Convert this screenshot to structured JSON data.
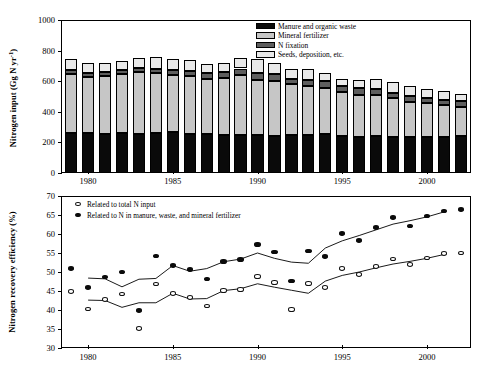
{
  "figure": {
    "panels": [
      "nitrogen-input-stacked-bar",
      "nitrogen-recovery-efficiency-scatter"
    ]
  },
  "top_panel": {
    "y_axis_title_main": "Nitrogen input (Gg N yr",
    "y_axis_title_sup": "-1",
    "y_axis_title_close": ")",
    "y_ticks": [
      "0",
      "200",
      "400",
      "600",
      "800",
      "1000"
    ],
    "x_ticks": [
      "1980",
      "1985",
      "1990",
      "1995",
      "2000"
    ],
    "legend": [
      {
        "key": "manure",
        "label": "Manure and organic waste"
      },
      {
        "key": "mineral",
        "label": "Mineral fertilizer"
      },
      {
        "key": "fixation",
        "label": "N fixation"
      },
      {
        "key": "seeds",
        "label": "Seeds, deposition, etc."
      }
    ]
  },
  "bottom_panel": {
    "y_axis_title": "Nitrogen recovery efficiency (%)",
    "y_ticks": [
      "30",
      "35",
      "40",
      "45",
      "50",
      "55",
      "60",
      "65",
      "70"
    ],
    "x_ticks": [
      "1980",
      "1985",
      "1990",
      "1995",
      "2000"
    ],
    "legend": [
      {
        "key": "open",
        "label": "Related to total N input"
      },
      {
        "key": "filled",
        "label": "Related to N in manure, waste, and mineral fertilizer"
      }
    ]
  },
  "colors": {
    "manure": "#0a0a0a",
    "mineral": "#c6c6c6",
    "fixation": "#5e5e5e",
    "seeds": "#e9e9e9",
    "axis": "#000000",
    "open_marker_fill": "#ffffff",
    "filled_marker_fill": "#0b0b0b"
  },
  "chart_data": [
    {
      "type": "bar",
      "id": "nitrogen-input-stacked-bar",
      "title": "",
      "xlabel": "",
      "ylabel": "Nitrogen input (Gg N yr-1)",
      "ylim": [
        0,
        1000
      ],
      "ytick_step": 200,
      "xlim": [
        1978.4,
        2002.6
      ],
      "grid": false,
      "stacked": true,
      "legend_position": "top-right-inside",
      "categories": [
        1979,
        1980,
        1981,
        1982,
        1983,
        1984,
        1985,
        1986,
        1987,
        1988,
        1989,
        1990,
        1991,
        1992,
        1993,
        1994,
        1995,
        1996,
        1997,
        1998,
        1999,
        2000,
        2001,
        2002
      ],
      "series": [
        {
          "name": "Manure and organic waste",
          "values": [
            262,
            261,
            258,
            259,
            258,
            264,
            266,
            258,
            254,
            251,
            249,
            248,
            244,
            249,
            247,
            254,
            242,
            236,
            242,
            238,
            237,
            235,
            238,
            240
          ]
        },
        {
          "name": "Mineral fertilizer",
          "values": [
            385,
            368,
            378,
            385,
            403,
            390,
            374,
            375,
            360,
            371,
            389,
            357,
            360,
            333,
            322,
            302,
            286,
            276,
            268,
            252,
            228,
            224,
            204,
            190
          ]
        },
        {
          "name": "N fixation",
          "values": [
            27,
            26,
            23,
            26,
            25,
            28,
            31,
            32,
            37,
            38,
            45,
            47,
            44,
            35,
            36,
            43,
            40,
            42,
            36,
            36,
            38,
            32,
            38,
            38
          ]
        },
        {
          "name": "Seeds, deposition, etc.",
          "values": [
            68,
            61,
            61,
            62,
            68,
            73,
            74,
            76,
            64,
            61,
            68,
            91,
            73,
            64,
            76,
            55,
            49,
            51,
            66,
            66,
            66,
            60,
            56,
            50
          ]
        }
      ],
      "totals": [
        742,
        716,
        720,
        732,
        754,
        755,
        745,
        741,
        715,
        721,
        751,
        743,
        721,
        681,
        681,
        654,
        617,
        605,
        612,
        592,
        569,
        551,
        536,
        518
      ]
    },
    {
      "type": "scatter",
      "id": "nitrogen-recovery-efficiency-scatter",
      "title": "",
      "xlabel": "",
      "ylabel": "Nitrogen recovery efficiency (%)",
      "ylim": [
        30,
        70
      ],
      "ytick_step": 5,
      "xlim": [
        1978.4,
        2002.6
      ],
      "grid": false,
      "legend_position": "top-left-inside",
      "x": [
        1979,
        1980,
        1981,
        1982,
        1983,
        1984,
        1985,
        1986,
        1987,
        1988,
        1989,
        1990,
        1991,
        1992,
        1993,
        1994,
        1995,
        1996,
        1997,
        1998,
        1999,
        2000,
        2001,
        2002
      ],
      "series": [
        {
          "name": "Related to total N input",
          "marker": "open-circle",
          "values": [
            44.9,
            40.3,
            42.8,
            44.2,
            35.2,
            46.8,
            44.3,
            43.3,
            41.1,
            45.1,
            45.4,
            48.8,
            47.3,
            40.2,
            46.9,
            45.9,
            50.9,
            49.3,
            51.4,
            53.4,
            51.9,
            53.7,
            54.8,
            55.0
          ],
          "trend": [
            null,
            42.6,
            42.5,
            40.7,
            41.9,
            41.9,
            44.4,
            42.9,
            43.0,
            45.1,
            45.6,
            46.9,
            46.0,
            45.2,
            44.4,
            47.6,
            49.1,
            50.0,
            51.1,
            52.1,
            52.8,
            53.6,
            54.6,
            null
          ]
        },
        {
          "name": "Related to N in manure, waste, and mineral fertilizer",
          "marker": "filled-circle",
          "values": [
            50.9,
            45.9,
            48.7,
            50.0,
            39.8,
            54.2,
            51.7,
            50.7,
            48.2,
            52.8,
            53.3,
            57.3,
            55.3,
            47.6,
            55.5,
            54.1,
            60.2,
            58.3,
            61.7,
            64.4,
            62.1,
            64.7,
            66.1,
            66.4
          ],
          "trend": [
            null,
            48.4,
            48.2,
            46.1,
            48.1,
            48.3,
            51.7,
            50.2,
            50.9,
            52.7,
            53.4,
            55.0,
            53.6,
            52.6,
            52.3,
            56.3,
            58.2,
            59.6,
            61.1,
            62.6,
            63.5,
            64.5,
            65.8,
            null
          ]
        }
      ]
    }
  ]
}
